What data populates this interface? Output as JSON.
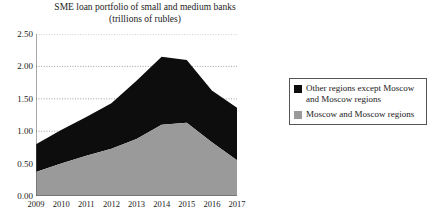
{
  "chart_data": {
    "type": "area",
    "stacked": true,
    "title": "SME loan portfolio of small and medium banks",
    "subtitle": "(trillions of rubles)",
    "xlabel": "",
    "ylabel": "",
    "categories": [
      "2009",
      "2010",
      "2011",
      "2012",
      "2013",
      "2014",
      "2015",
      "2016",
      "2017"
    ],
    "x": [
      2009,
      2010,
      2011,
      2012,
      2013,
      2014,
      2015,
      2016,
      2017
    ],
    "ylim": [
      0.0,
      2.5
    ],
    "ytick_labels": [
      "0.00",
      "0.50",
      "1.00",
      "1.50",
      "2.00",
      "2.50"
    ],
    "yticks": [
      0.0,
      0.5,
      1.0,
      1.5,
      2.0,
      2.5
    ],
    "grid": true,
    "grid_style": "dotted-horizontal",
    "legend_position": "right",
    "series": [
      {
        "name": "Moscow and Moscow regions",
        "color": "#9a9a9a",
        "values": [
          0.37,
          0.5,
          0.62,
          0.73,
          0.88,
          1.1,
          1.13,
          0.83,
          0.55
        ]
      },
      {
        "name": "Other regions except Moscow and Moscow regions",
        "color": "#0d0d0d",
        "values": [
          0.43,
          0.52,
          0.6,
          0.7,
          0.9,
          1.05,
          0.97,
          0.8,
          0.81
        ]
      }
    ],
    "stacked_totals": [
      0.8,
      1.02,
      1.22,
      1.43,
      1.78,
      2.15,
      2.1,
      1.63,
      1.36
    ]
  },
  "legend": {
    "items": [
      {
        "label": "Other regions except Moscow and Moscow regions",
        "color": "#0d0d0d"
      },
      {
        "label": "Moscow and Moscow regions",
        "color": "#9a9a9a"
      }
    ]
  }
}
